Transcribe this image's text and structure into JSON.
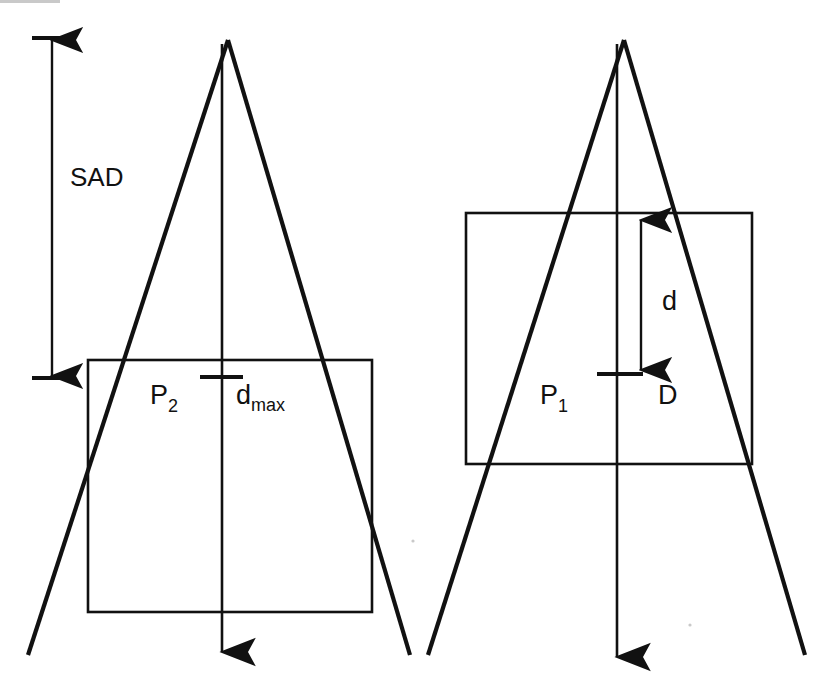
{
  "figure": {
    "background_color": "#ffffff",
    "ink_color": "#111111",
    "width": 834,
    "height": 685
  },
  "labels": {
    "sad": "SAD",
    "p2": "P",
    "p2_sub": "2",
    "dmax": "d",
    "dmax_sub": "max",
    "p1": "P",
    "p1_sub": "1",
    "d_depth": "d",
    "d_dose": "D"
  },
  "left_panel": {
    "name": "dmax-setup-panel",
    "source_apex": {
      "x": 228,
      "y": 38
    },
    "central_axis": {
      "x": 222,
      "y_top": 38,
      "y_bottom": 665
    },
    "phantom_rect": {
      "x": 88,
      "y": 360,
      "width": 284,
      "height": 252
    },
    "beam_left_edge": {
      "x1": 228,
      "y1": 40,
      "x2": 28,
      "y2": 655
    },
    "beam_right_edge": {
      "x1": 228,
      "y1": 40,
      "x2": 410,
      "y2": 655
    },
    "depth_tick": {
      "y": 377,
      "x1": 200,
      "x2": 243
    },
    "label_p2_pos": {
      "x": 150,
      "y": 404
    },
    "label_dmax_pos": {
      "x": 236,
      "y": 404
    }
  },
  "right_panel": {
    "name": "depth-d-setup-panel",
    "source_apex": {
      "x": 624,
      "y": 38
    },
    "central_axis": {
      "x": 617,
      "y_top": 38,
      "y_bottom": 670
    },
    "phantom_rect": {
      "x": 466,
      "y": 213,
      "width": 286,
      "height": 251
    },
    "beam_left_edge": {
      "x1": 624,
      "y1": 40,
      "x2": 428,
      "y2": 655
    },
    "beam_right_edge": {
      "x1": 624,
      "y1": 40,
      "x2": 805,
      "y2": 655
    },
    "depth_arrow": {
      "x": 641,
      "y_top": 216,
      "y_bottom": 374
    },
    "depth_tick": {
      "y": 374,
      "x1": 597,
      "x2": 643
    },
    "label_p1_pos": {
      "x": 540,
      "y": 404
    },
    "label_d_depth_pos": {
      "x": 662,
      "y": 310
    },
    "label_d_dose_pos": {
      "x": 658,
      "y": 404
    }
  },
  "sad_dimension": {
    "name": "sad-dimension",
    "x": 52,
    "y_top": 40,
    "y_bottom": 376,
    "top_tick": {
      "y": 38,
      "x1": 32,
      "x2": 76
    },
    "bottom_tick": {
      "y": 378,
      "x1": 32,
      "x2": 76
    },
    "label_pos": {
      "x": 70,
      "y": 186
    }
  }
}
